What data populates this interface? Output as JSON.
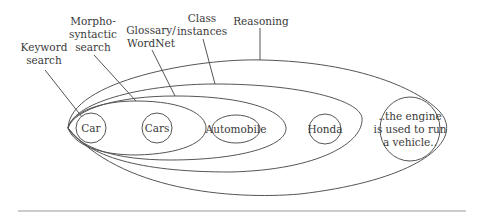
{
  "diagram": {
    "type": "nested-ellipses",
    "labels": {
      "keyword": [
        "Keyword",
        "search"
      ],
      "morpho": [
        "Morpho-",
        "syntactic",
        "search"
      ],
      "glossary": [
        "Glossary/",
        "WordNet"
      ],
      "class": [
        "Class",
        "instances"
      ],
      "reasoning": [
        "Reasoning"
      ]
    },
    "nodes": {
      "car": "Car",
      "cars": "Cars",
      "automobile": "Automobile",
      "honda": "Honda",
      "engine": [
        "..the engine",
        "is used to run",
        "a vehicle.."
      ]
    },
    "colors": {
      "stroke": "#555555",
      "text": "#3a3a3a",
      "rule": "#9a9a9a"
    }
  }
}
